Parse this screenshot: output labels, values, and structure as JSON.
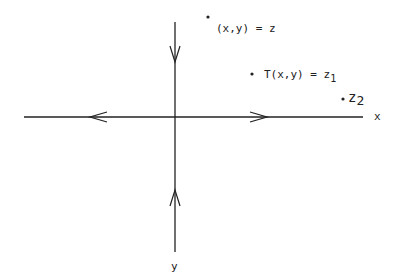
{
  "diagram": {
    "axes": {
      "x_label": "x",
      "y_label": "y",
      "horizontal": {
        "x1": 24,
        "x2": 363,
        "y": 117
      },
      "vertical": {
        "x": 175,
        "y1": 22,
        "y2": 252
      }
    },
    "arrows": [
      {
        "axis": "horizontal",
        "direction": "left",
        "at": 96
      },
      {
        "axis": "horizontal",
        "direction": "right",
        "at": 262
      },
      {
        "axis": "vertical",
        "direction": "down",
        "at": 58
      },
      {
        "axis": "vertical",
        "direction": "up",
        "at": 196
      }
    ],
    "points": [
      {
        "id": "p0",
        "label": "(x,y) = z",
        "subscript": "",
        "x": 208,
        "y": 17
      },
      {
        "id": "p1",
        "label": "T(x,y) = z",
        "subscript": "1",
        "x": 252,
        "y": 74
      },
      {
        "id": "p2",
        "label": "z",
        "subscript": "2",
        "x": 343,
        "y": 99
      }
    ],
    "colors": {
      "ink": "#222222",
      "background": "#ffffff"
    }
  }
}
